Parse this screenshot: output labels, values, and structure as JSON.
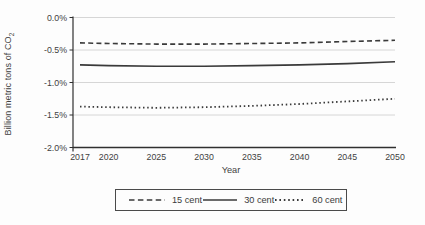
{
  "chart_data": {
    "type": "line",
    "title": "",
    "xlabel": "Year",
    "ylabel": "Billion metric tons of CO2",
    "ylabel_main": "Billion metric tons of CO",
    "ylabel_sub": "2",
    "x": [
      2017,
      2020,
      2025,
      2030,
      2035,
      2040,
      2045,
      2050
    ],
    "xlim": [
      2017,
      2050
    ],
    "ylim": [
      -2.0,
      0.0
    ],
    "grid": true,
    "legend_position": "bottom",
    "yticks": [
      {
        "value": 0.0,
        "label": "0.0%"
      },
      {
        "value": -0.5,
        "label": "-0.5%"
      },
      {
        "value": -1.0,
        "label": "-1.0%"
      },
      {
        "value": -1.5,
        "label": "-1.5%"
      },
      {
        "value": -2.0,
        "label": "-2.0%"
      }
    ],
    "series": [
      {
        "name": "15 cent",
        "line_style": "dashed",
        "values": [
          -0.39,
          -0.4,
          -0.41,
          -0.41,
          -0.4,
          -0.39,
          -0.37,
          -0.35
        ]
      },
      {
        "name": "30 cent",
        "line_style": "solid",
        "values": [
          -0.73,
          -0.74,
          -0.75,
          -0.75,
          -0.74,
          -0.73,
          -0.71,
          -0.68
        ]
      },
      {
        "name": "60 cent",
        "line_style": "dotted",
        "values": [
          -1.37,
          -1.38,
          -1.39,
          -1.38,
          -1.36,
          -1.33,
          -1.29,
          -1.25
        ]
      }
    ],
    "colors": {
      "line": "#3a3a3a",
      "axis": "#303030",
      "gridline": "#d6d6d6",
      "text": "#3f3f3f",
      "background": "#fdfdfd"
    }
  }
}
